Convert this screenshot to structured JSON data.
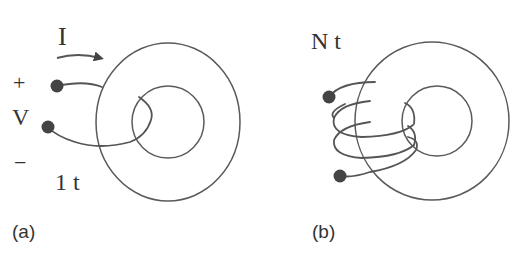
{
  "figure": {
    "panel_a": {
      "caption": "(a)",
      "current_label": "I",
      "plus_label": "+",
      "voltage_label": "V",
      "minus_label": "−",
      "turns_label": "1 t"
    },
    "panel_b": {
      "caption": "(b)",
      "turns_label": "N t"
    }
  },
  "colors": {
    "stroke": "#5a5a5a",
    "terminal": "#444444",
    "text": "#333333"
  }
}
